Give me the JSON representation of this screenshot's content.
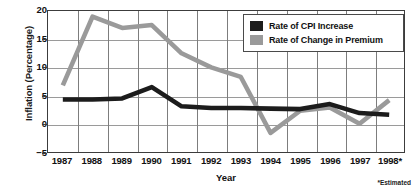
{
  "chart_data": {
    "type": "line",
    "title": "",
    "xlabel": "Year",
    "ylabel": "Inflation (Percentage)",
    "categories": [
      "1987",
      "1988",
      "1989",
      "1990",
      "1991",
      "1992",
      "1993",
      "1994",
      "1995",
      "1996",
      "1997",
      "1998*"
    ],
    "ylim": [
      -5,
      20
    ],
    "yticks": [
      "20",
      "15",
      "10",
      "5",
      "0",
      "−5"
    ],
    "ytick_values": [
      20,
      15,
      10,
      5,
      0,
      -5
    ],
    "grid": true,
    "legend_position": "top-right",
    "footnote": "*Estimated",
    "series": [
      {
        "name": "Rate of CPI Increase",
        "color": "#1c1c1c",
        "values": [
          4.3,
          4.3,
          4.5,
          6.5,
          3.1,
          2.8,
          2.8,
          2.7,
          2.6,
          3.5,
          1.9,
          1.6
        ]
      },
      {
        "name": "Rate of Change in Premium",
        "color": "#9a9a9a",
        "values": [
          6.8,
          19.0,
          17.0,
          17.5,
          12.5,
          10.0,
          8.3,
          -1.6,
          2.3,
          2.9,
          0.0,
          4.2
        ]
      }
    ]
  },
  "legend": {
    "items": [
      {
        "label": "Rate of CPI Increase",
        "color": "#1c1c1c"
      },
      {
        "label": "Rate of Change in Premium",
        "color": "#9a9a9a"
      }
    ]
  }
}
